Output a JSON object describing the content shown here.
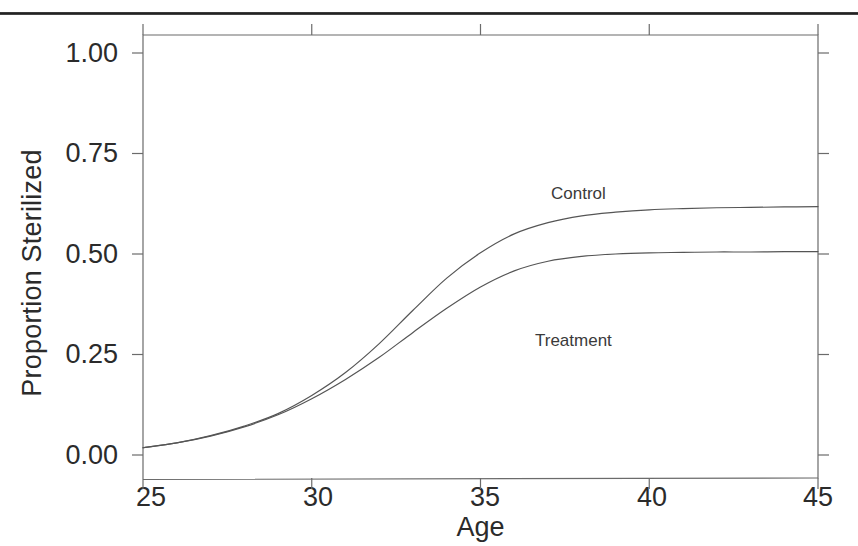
{
  "figure": {
    "background_color": "#ffffff",
    "page_edge_color": "#1d1d1d",
    "axis_color": "#6b6b6b",
    "curve_color": "#555555",
    "text_color": "#2b2b2b"
  },
  "chart_data": {
    "type": "line",
    "title": "",
    "subtitle": "",
    "xlabel": "Age",
    "ylabel": "Proportion Sterilized",
    "xlim": [
      25,
      45
    ],
    "ylim": [
      0.0,
      1.0
    ],
    "xticks": [
      25,
      30,
      35,
      40,
      45
    ],
    "xtick_labels": [
      "25",
      "30",
      "35",
      "40",
      "45"
    ],
    "yticks": [
      0.0,
      0.25,
      0.5,
      0.75,
      1.0
    ],
    "ytick_labels": [
      "0.00",
      "0.25",
      "0.50",
      "0.75",
      "1.00"
    ],
    "grid": false,
    "legend_position": "inline-annotations",
    "annotations": [
      {
        "text": "Control",
        "x": 37.5,
        "y": 0.67
      },
      {
        "text": "Treatment",
        "x": 37.1,
        "y": 0.295
      }
    ],
    "x": [
      25,
      26,
      27,
      28,
      29,
      30,
      31,
      32,
      33,
      34,
      35,
      36,
      37,
      38,
      39,
      40,
      41,
      42,
      43,
      44,
      45
    ],
    "series": [
      {
        "name": "Control",
        "color": "#555555",
        "values": [
          0.018,
          0.03,
          0.048,
          0.072,
          0.103,
          0.148,
          0.205,
          0.277,
          0.36,
          0.44,
          0.503,
          0.55,
          0.578,
          0.595,
          0.604,
          0.61,
          0.613,
          0.615,
          0.616,
          0.617,
          0.618
        ]
      },
      {
        "name": "Treatment",
        "color": "#555555",
        "values": [
          0.018,
          0.03,
          0.047,
          0.07,
          0.1,
          0.14,
          0.188,
          0.243,
          0.305,
          0.365,
          0.418,
          0.458,
          0.482,
          0.494,
          0.5,
          0.503,
          0.504,
          0.505,
          0.505,
          0.506,
          0.506
        ]
      }
    ]
  },
  "axes": {
    "plot_left_px": 143,
    "plot_right_px": 818,
    "plot_top_px": 35,
    "plot_bottom_px": 478,
    "y_top_value_px": 53,
    "y_bottom_value_px": 455
  }
}
